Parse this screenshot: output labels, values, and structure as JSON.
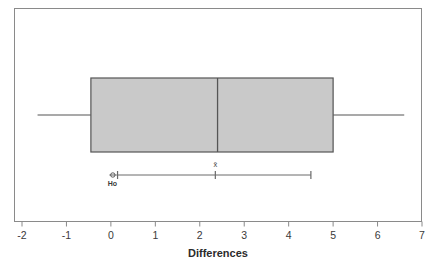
{
  "chart_data": {
    "type": "boxplot",
    "title": "",
    "xlabel": "Differences",
    "ylabel": "",
    "xlim": [
      -2,
      7
    ],
    "xticks": [
      -2,
      -1,
      0,
      1,
      2,
      3,
      4,
      5,
      6,
      7
    ],
    "xtick_labels": [
      "-2",
      "-1",
      "0",
      "1",
      "2",
      "3",
      "4",
      "5",
      "6",
      "7"
    ],
    "grid": false,
    "legend": null,
    "orientation": "horizontal",
    "box": {
      "whisker_low": -1.65,
      "q1": -0.45,
      "median": 2.4,
      "q3": 5.0,
      "whisker_high": 6.6,
      "fill_color": "#c9c9c9",
      "line_color": "#555555"
    },
    "annotations": [
      {
        "name": "mean-marker",
        "label": "x̄",
        "value": 2.35,
        "kind": "tick"
      },
      {
        "name": "confidence-interval",
        "label": "",
        "low": 0.15,
        "high": 4.5,
        "kind": "interval"
      },
      {
        "name": "null-hypothesis-marker",
        "label": "Ho",
        "value": 0.1,
        "kind": "circle-marker"
      }
    ]
  },
  "figure": {
    "frame_color": "#8a8a8a",
    "background": "#ffffff",
    "axis_title": "Differences"
  },
  "labels": {
    "mean_symbol": "x̄",
    "null_hypothesis": "Ho"
  }
}
